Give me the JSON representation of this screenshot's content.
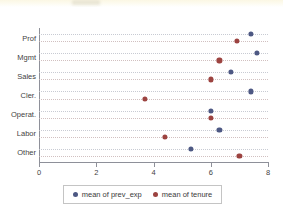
{
  "chart_data": {
    "type": "scatter",
    "title": "",
    "subtitle": "",
    "xlabel": "",
    "ylabel": "",
    "orientation": "horizontal",
    "categories": [
      "Prof",
      "Mgmt",
      "Sales",
      "Cler.",
      "Operat.",
      "Labor",
      "Other"
    ],
    "xlim": [
      0,
      8
    ],
    "xticks": [
      0,
      2,
      4,
      6,
      8
    ],
    "xtick_labels": [
      "0",
      "2",
      "4",
      "6",
      "8"
    ],
    "grid": "horizontal-dotted",
    "legend_position": "bottom",
    "series": [
      {
        "name": "mean of prev_exp",
        "color": "#4d5883",
        "marker": "circle",
        "values": [
          7.4,
          7.6,
          6.7,
          7.4,
          6.0,
          6.3,
          5.3
        ]
      },
      {
        "name": "mean of tenure",
        "color": "#9c4340",
        "marker": "circle",
        "values": [
          6.9,
          6.3,
          6.0,
          3.7,
          6.0,
          4.4,
          7.0
        ]
      }
    ]
  },
  "legend": {
    "entries": [
      {
        "label": "mean of prev_exp",
        "color": "#4d5883"
      },
      {
        "label": "mean of tenure",
        "color": "#9c4340"
      }
    ]
  }
}
